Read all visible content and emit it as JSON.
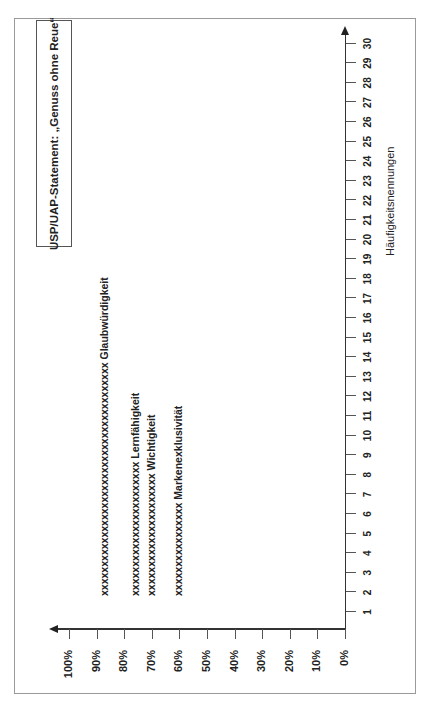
{
  "chart_data": {
    "type": "scatter",
    "orientation": "rotated-90-ccw",
    "title": "USP/UAP-Statement: „Genuss ohne Reue“",
    "xlabel": "Häufigkeitsnennungen",
    "ylabel": "",
    "x_ticks": [
      "1",
      "2",
      "3",
      "4",
      "5",
      "6",
      "7",
      "8",
      "9",
      "10",
      "11",
      "12",
      "13",
      "14",
      "15",
      "16",
      "17",
      "18",
      "19",
      "20",
      "21",
      "22",
      "23",
      "24",
      "25",
      "26",
      "27",
      "28",
      "29",
      "30"
    ],
    "y_ticks": [
      "0%",
      "10%",
      "20%",
      "30%",
      "40%",
      "50%",
      "60%",
      "70%",
      "80%",
      "90%",
      "100%"
    ],
    "xlim": [
      0,
      30
    ],
    "ylim": [
      0,
      100
    ],
    "grid": false,
    "series": [
      {
        "name": "Glaubwürdigkeit",
        "percent": 87,
        "marks": "xxxxxxxxxxxxxxxxxxxxxxxxxxxxxxxxxxxxxxxx",
        "count": 13
      },
      {
        "name": "Lernfähigkeit",
        "percent": 76,
        "marks": "xxxxxxxxxxxxxxxxxxxxxxx",
        "count": 8
      },
      {
        "name": "Wichtigkeit",
        "percent": 70,
        "marks": "xxxxxxxxxxxxxxxxxxxxx",
        "count": 7
      },
      {
        "name": "Markenexklusivität",
        "percent": 60,
        "marks": "xxxxxxxxxxxxxxxx",
        "count": 5
      }
    ]
  },
  "title": "USP/UAP-Statement: „Genuss ohne Reue“",
  "x_axis_title": "Häufigkeitsnennungen",
  "freq_ticks": [
    "1",
    "2",
    "3",
    "4",
    "5",
    "6",
    "7",
    "8",
    "9",
    "10",
    "11",
    "12",
    "13",
    "14",
    "15",
    "16",
    "17",
    "18",
    "19",
    "20",
    "21",
    "22",
    "23",
    "24",
    "25",
    "26",
    "27",
    "28",
    "29",
    "30"
  ],
  "pct_ticks": [
    "0%",
    "10%",
    "20%",
    "30%",
    "40%",
    "50%",
    "60%",
    "70%",
    "80%",
    "90%",
    "100%"
  ],
  "rows": [
    {
      "marks": "xxxxxxxxxxxxxxxxxxxxxxxxxxxxxxxxxxxxxxxx",
      "label": "Glaubwürdigkeit",
      "percent": 87
    },
    {
      "marks": "xxxxxxxxxxxxxxxxxxxxxxx",
      "label": "Lernfähigkeit",
      "percent": 76
    },
    {
      "marks": "xxxxxxxxxxxxxxxxxxxxx",
      "label": "Wichtigkeit",
      "percent": 70
    },
    {
      "marks": "xxxxxxxxxxxxxxxx",
      "label": "Markenexklusivität",
      "percent": 60
    }
  ]
}
